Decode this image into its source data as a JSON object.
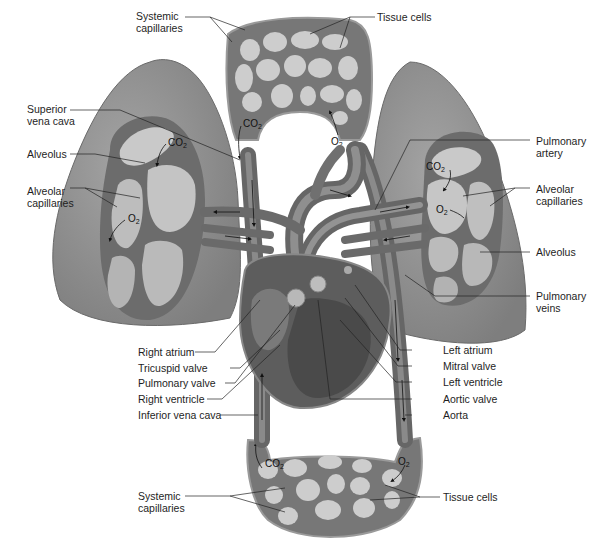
{
  "figure": {
    "labels": {
      "systemic_capillaries_top": "Systemic\ncapillaries",
      "tissue_cells_top": "Tissue cells",
      "superior_vena_cava": "Superior\nvena cava",
      "alveolus_left": "Alveolus",
      "alveolar_capillaries_left": "Alveolar\ncapillaries",
      "pulmonary_artery": "Pulmonary\nartery",
      "alveolar_capillaries_right": "Alveolar\ncapillaries",
      "alveolus_right": "Alveolus",
      "pulmonary_veins": "Pulmonary\nveins",
      "right_atrium": "Right atrium",
      "tricuspid_valve": "Tricuspid valve",
      "pulmonary_valve": "Pulmonary valve",
      "right_ventricle": "Right ventricle",
      "inferior_vena_cava": "Inferior vena cava",
      "left_atrium": "Left atrium",
      "mitral_valve": "Mitral valve",
      "left_ventricle": "Left ventricle",
      "aortic_valve": "Aortic valve",
      "aorta": "Aorta",
      "systemic_capillaries_bottom": "Systemic\ncapillaries",
      "tissue_cells_bottom": "Tissue cells"
    },
    "gases": {
      "co2": "CO2",
      "o2": "O2"
    },
    "colors": {
      "lung": "#8f8f8f",
      "lung_light": "#a8a8a8",
      "vessel": "#6e6e6e",
      "capillary_bed": "#7a7a7a",
      "cell": "#cfcfcf",
      "heart": "#5f5f5f",
      "label_text": "#1e1e1e"
    }
  }
}
